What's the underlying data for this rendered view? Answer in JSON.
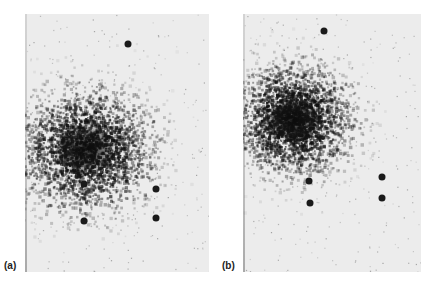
{
  "figure": {
    "panels": [
      {
        "label": "(a)",
        "box": {
          "x": 25,
          "y": 14,
          "w": 184,
          "h": 258
        },
        "cloud": {
          "cx": 60,
          "cy": 135,
          "rx": 55,
          "ry": 50
        },
        "spots": [
          {
            "x": 103,
            "y": 30
          },
          {
            "x": 59,
            "y": 170
          },
          {
            "x": 131,
            "y": 175
          },
          {
            "x": 59,
            "y": 207
          },
          {
            "x": 131,
            "y": 204
          }
        ]
      },
      {
        "label": "(b)",
        "box": {
          "x": 243,
          "y": 14,
          "w": 178,
          "h": 258
        },
        "cloud": {
          "cx": 50,
          "cy": 105,
          "rx": 48,
          "ry": 45
        },
        "spots": [
          {
            "x": 81,
            "y": 17
          },
          {
            "x": 66,
            "y": 167
          },
          {
            "x": 139,
            "y": 163
          },
          {
            "x": 67,
            "y": 189
          },
          {
            "x": 139,
            "y": 184
          }
        ]
      }
    ]
  }
}
